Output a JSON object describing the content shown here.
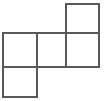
{
  "figure": {
    "name": "polyomino-net",
    "background_color": "#ffffff",
    "stroke_color": "#595959",
    "stroke_width": 1.4,
    "canvas": {
      "width": 106,
      "height": 101
    },
    "grid": {
      "x_lines": [
        3,
        37,
        66,
        99
      ],
      "y_lines": [
        4,
        33,
        67,
        97
      ],
      "cell_width": 32,
      "cell_height": 31
    },
    "squares": [
      {
        "id": "top-right-square",
        "row": 0,
        "col": 2,
        "x": 66,
        "y": 4,
        "width": 33,
        "height": 29
      },
      {
        "id": "middle-left-square",
        "row": 1,
        "col": 0,
        "x": 3,
        "y": 33,
        "width": 34,
        "height": 34
      },
      {
        "id": "middle-center-square",
        "row": 1,
        "col": 1,
        "x": 37,
        "y": 33,
        "width": 29,
        "height": 34
      },
      {
        "id": "middle-right-square",
        "row": 1,
        "col": 2,
        "x": 66,
        "y": 33,
        "width": 33,
        "height": 34
      },
      {
        "id": "bottom-left-square",
        "row": 2,
        "col": 0,
        "x": 3,
        "y": 67,
        "width": 34,
        "height": 30
      }
    ],
    "segments": [
      {
        "id": "top-square-top-edge",
        "x1": 66,
        "y1": 4,
        "x2": 99,
        "y2": 4
      },
      {
        "id": "top-square-left-edge",
        "x1": 66,
        "y1": 4,
        "x2": 66,
        "y2": 33
      },
      {
        "id": "top-square-right-edge",
        "x1": 99,
        "y1": 4,
        "x2": 99,
        "y2": 33
      },
      {
        "id": "middle-row-top-edge",
        "x1": 3,
        "y1": 33,
        "x2": 99,
        "y2": 33
      },
      {
        "id": "middle-row-bottom-edge",
        "x1": 3,
        "y1": 67,
        "x2": 99,
        "y2": 67
      },
      {
        "id": "middle-row-left-edge",
        "x1": 3,
        "y1": 33,
        "x2": 3,
        "y2": 67
      },
      {
        "id": "middle-row-divider-first",
        "x1": 37,
        "y1": 33,
        "x2": 37,
        "y2": 67
      },
      {
        "id": "middle-row-divider-second",
        "x1": 66,
        "y1": 33,
        "x2": 66,
        "y2": 67
      },
      {
        "id": "middle-row-right-edge",
        "x1": 99,
        "y1": 33,
        "x2": 99,
        "y2": 67
      },
      {
        "id": "bottom-square-left-edge",
        "x1": 3,
        "y1": 67,
        "x2": 3,
        "y2": 97
      },
      {
        "id": "bottom-square-right-edge",
        "x1": 37,
        "y1": 67,
        "x2": 37,
        "y2": 97
      },
      {
        "id": "bottom-square-bottom-edge",
        "x1": 3,
        "y1": 97,
        "x2": 37,
        "y2": 97
      }
    ]
  }
}
